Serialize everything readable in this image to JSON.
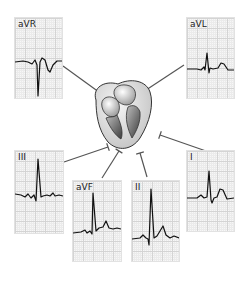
{
  "diagram": {
    "title": "",
    "center": {
      "name": "heart",
      "x": 122,
      "y": 117
    },
    "leads": [
      {
        "id": "aVR",
        "label": "aVR",
        "x": 14,
        "y": 17,
        "w": 47,
        "h": 80,
        "arrow_from": [
          63,
          66
        ],
        "arrow_to": [
          103,
          95
        ],
        "trace": "M0,44 L8,43 L13,44 L17,46 L20,42 L22,47 L23,78 L25,44 L27,40 L30,42 L33,52 L35,54 L38,47 L42,43 L47,43"
      },
      {
        "id": "aVL",
        "label": "aVL",
        "x": 186,
        "y": 17,
        "w": 47,
        "h": 80,
        "arrow_from": [
          184,
          65
        ],
        "arrow_to": [
          143,
          92
        ],
        "trace": "M0,51 L10,51 L14,52 L17,49 L18,52 L20,35 L22,55 L23,50 L26,51 L31,50 L34,45 L37,46 L41,52 L47,52"
      },
      {
        "id": "III",
        "label": "III",
        "x": 14,
        "y": 150,
        "w": 48,
        "h": 82,
        "arrow_from": [
          64,
          162
        ],
        "arrow_to": [
          108,
          147
        ],
        "trace": "M0,43 L6,44 L10,46 L13,43 L16,47 L19,44 L21,50 L23,8 L26,46 L28,45 L32,44 L35,45 L38,42 L40,45 L44,44 L48,45"
      },
      {
        "id": "aVF",
        "label": "aVF",
        "x": 72,
        "y": 180,
        "w": 48,
        "h": 80,
        "arrow_from": [
          102,
          178
        ],
        "arrow_to": [
          119,
          151
        ],
        "trace": "M0,52 L8,51 L12,49 L14,52 L17,50 L19,53 L20,12 L23,50 L26,47 L30,46 L33,40 L36,47 L40,48 L44,47 L48,48"
      },
      {
        "id": "II",
        "label": "II",
        "x": 131,
        "y": 180,
        "w": 47,
        "h": 80,
        "arrow_from": [
          147,
          177
        ],
        "arrow_to": [
          140,
          153
        ],
        "trace": "M0,58 L8,57 L11,54 L14,57 L16,58 L17,64 L19,8 L22,57 L25,55 L28,50 L31,45 L34,54 L38,57 L42,55 L47,57"
      },
      {
        "id": "I",
        "label": "I",
        "x": 186,
        "y": 150,
        "w": 47,
        "h": 80,
        "arrow_from": [
          206,
          151
        ],
        "arrow_to": [
          160,
          135
        ],
        "trace": "M0,47 L10,47 L14,44 L17,47 L20,46 L22,20 L24,49 L25,52 L27,47 L30,46 L33,38 L36,39 L40,48 L47,47"
      }
    ],
    "colors": {
      "trace": "#111111",
      "arrow": "#555555",
      "grid_major": "#d4d4d4",
      "grid_minor": "#ebebeb",
      "panel_bg": "#f7f7f7"
    }
  }
}
